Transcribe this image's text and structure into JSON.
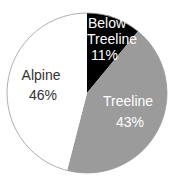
{
  "chart_data": {
    "type": "pie",
    "title": "",
    "categories": [
      "Below Treeline",
      "Treeline",
      "Alpine"
    ],
    "values": [
      11,
      43,
      46
    ],
    "unit": "%",
    "start_angle_deg": 0,
    "direction": "clockwise",
    "legend": "none",
    "slices": [
      {
        "name": "Below Treeline",
        "value": 11,
        "label_lines": [
          "Below",
          "Treeline",
          "11%"
        ],
        "color": "#000000",
        "text_color": "#ffffff"
      },
      {
        "name": "Treeline",
        "value": 43,
        "label_lines": [
          "Treeline",
          "43%"
        ],
        "color": "#9b9b9b",
        "text_color": "#ffffff"
      },
      {
        "name": "Alpine",
        "value": 46,
        "label_lines": [
          "Alpine",
          "46%"
        ],
        "color": "#ffffff",
        "text_color": "#333333"
      }
    ],
    "outline_color": "#9a9a9a"
  }
}
